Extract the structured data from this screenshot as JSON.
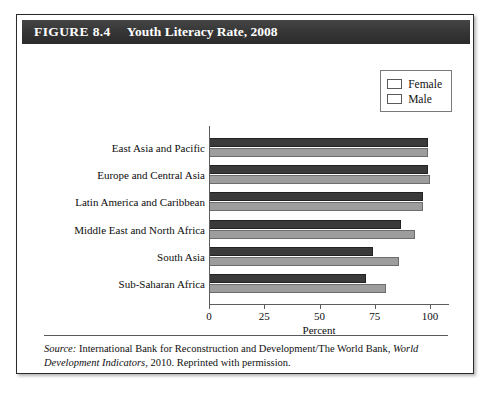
{
  "figure": {
    "label": "FIGURE 8.4",
    "title": "Youth Literacy Rate, 2008"
  },
  "source_note": {
    "prefix": "Source:",
    "body_1": " International Bank for Reconstruction and Development/The World Bank, ",
    "italic_title": "World Development Indicators",
    "body_2": ", 2010. Reprinted with permission."
  },
  "colors": {
    "female_bar": "#3a3a3a",
    "male_bar": "#9d9d9d",
    "header_bg": "#333333",
    "card_border": "#2a2a2a",
    "axis": "#5d5d5d"
  },
  "chart_data": {
    "type": "bar",
    "orientation": "horizontal",
    "title": "Youth Literacy Rate, 2008",
    "xlabel": "Percent",
    "ylabel": "",
    "xlim": [
      0,
      100
    ],
    "xticks": [
      0,
      25,
      50,
      75,
      100
    ],
    "grid": false,
    "legend_position": "top-right",
    "categories": [
      "East Asia and Pacific",
      "Europe and Central Asia",
      "Latin America and Caribbean",
      "Middle East and North Africa",
      "South Asia",
      "Sub-Saharan Africa"
    ],
    "series": [
      {
        "name": "Female",
        "color": "#3a3a3a",
        "values": [
          99,
          99,
          97,
          87,
          74,
          71
        ]
      },
      {
        "name": "Male",
        "color": "#9d9d9d",
        "values": [
          99,
          100,
          97,
          93,
          86,
          80
        ]
      }
    ]
  }
}
